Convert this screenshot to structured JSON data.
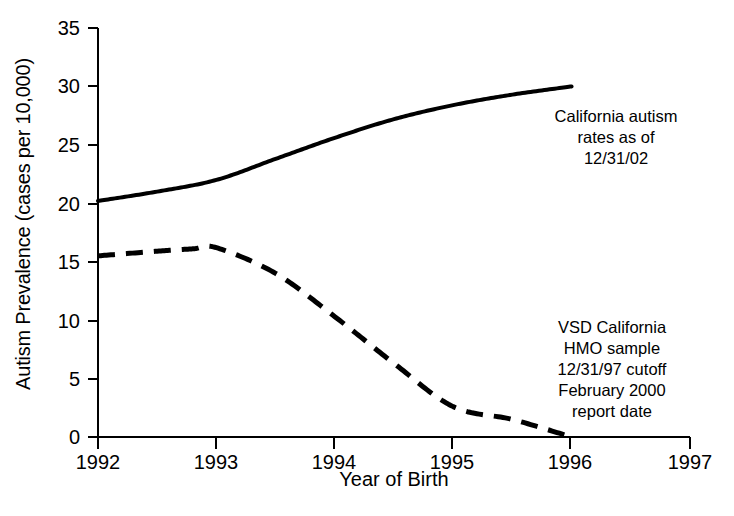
{
  "chart_data": {
    "type": "line",
    "title": "",
    "xlabel": "Year of Birth",
    "ylabel": "Autism Prevalence (cases per 10,000)",
    "xlim": [
      1992,
      1997
    ],
    "ylim": [
      0,
      35
    ],
    "xticks": [
      "1992",
      "1993",
      "1994",
      "1995",
      "1996",
      "1997"
    ],
    "yticks": [
      "0",
      "5",
      "10",
      "15",
      "20",
      "25",
      "30",
      "35"
    ],
    "grid": false,
    "legend_position": "inline annotations on plot",
    "series": [
      {
        "name": "California autism rates as of 12/31/02",
        "style": "solid",
        "color": "#000000",
        "x": [
          1992,
          1992.5,
          1993,
          1993.5,
          1994,
          1994.5,
          1995,
          1995.5,
          1996
        ],
        "values": [
          20.2,
          21.0,
          22.0,
          23.8,
          25.6,
          27.2,
          28.4,
          29.3,
          30.0
        ]
      },
      {
        "name": "VSD California HMO sample 12/31/97 cutoff February 2000 report date",
        "style": "dashed",
        "color": "#000000",
        "x": [
          1992,
          1992.5,
          1992.8,
          1993,
          1993.5,
          1994,
          1994.5,
          1995,
          1995.5,
          1996
        ],
        "values": [
          15.5,
          15.9,
          16.1,
          16.2,
          14.0,
          10.3,
          6.3,
          2.6,
          1.5,
          0.0
        ]
      }
    ],
    "annotations": [
      {
        "id": "solid-series-label",
        "lines": [
          "California autism",
          "rates as of",
          "12/31/02"
        ]
      },
      {
        "id": "dashed-series-label",
        "lines": [
          "VSD California",
          "HMO sample",
          "12/31/97 cutoff",
          "February 2000",
          "report date"
        ]
      }
    ]
  },
  "axes": {
    "y_title": "Autism Prevalence (cases per 10,000)",
    "x_title": "Year of Birth",
    "y_tick_labels": [
      "35",
      "30",
      "25",
      "20",
      "15",
      "10",
      "5",
      "0"
    ],
    "x_tick_labels": [
      "1992",
      "1993",
      "1994",
      "1995",
      "1996",
      "1997"
    ]
  },
  "annotations": {
    "solid": {
      "line1": "California autism",
      "line2": "rates as of",
      "line3": "12/31/02"
    },
    "dashed": {
      "line1": "VSD California",
      "line2": "HMO sample",
      "line3": "12/31/97 cutoff",
      "line4": "February 2000",
      "line5": "report date"
    }
  },
  "colors": {
    "ink": "#000000",
    "background": "#ffffff"
  }
}
